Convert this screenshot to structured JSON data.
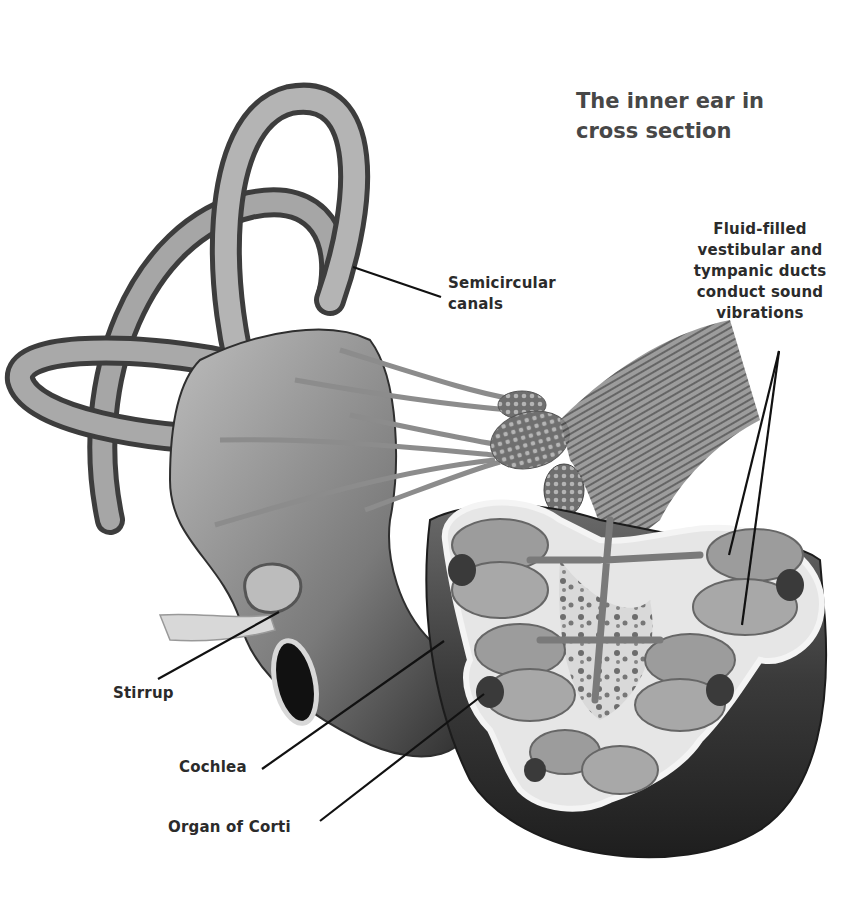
{
  "title": "The inner ear in\ncross section",
  "labels": {
    "semicircular_canals": "Semicircular\ncanals",
    "fluid_ducts": "Fluid-filled\nvestibular and\ntympanic ducts\nconduct sound\nvibrations",
    "stirrup": "Stirrup",
    "cochlea": "Cochlea",
    "organ_of_corti": "Organ of Corti"
  },
  "colors": {
    "background": "#ffffff",
    "label_text": "#2b2b2b",
    "title_text": "#474747",
    "leader_line": "#111111",
    "tissue_dark": "#3a3a3a",
    "tissue_mid": "#8a8a8a",
    "tissue_light": "#cfcfcf"
  }
}
